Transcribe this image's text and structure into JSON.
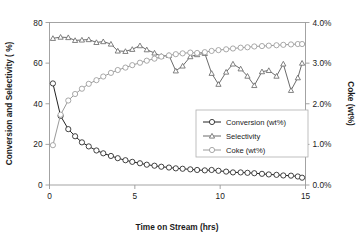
{
  "chart_data": {
    "type": "line",
    "title": "",
    "xlabel": "Time on Stream (hrs)",
    "ylabel": "Conversion and Selectivity ( %)",
    "ylabel_right": "Coke (wt%)",
    "xlim": [
      0,
      15
    ],
    "ylim": [
      0,
      80
    ],
    "ylim_right": [
      0.0,
      4.0
    ],
    "xticks": [
      0,
      5,
      10,
      15
    ],
    "xtick_labels": [
      "0",
      "5",
      "10",
      "15"
    ],
    "yticks": [
      0,
      20,
      40,
      60,
      80
    ],
    "ytick_labels": [
      "0",
      "20",
      "40",
      "60",
      "80"
    ],
    "yticks_right": [
      0.0,
      1.0,
      2.0,
      3.0,
      4.0
    ],
    "ytick_labels_right": [
      "0.0%",
      "1.0%",
      "2.0%",
      "3.0%",
      "4.0%"
    ],
    "grid": false,
    "legend_position": "center-right",
    "series": [
      {
        "name": "Conversion (wt%)",
        "axis": "left",
        "marker": "circle",
        "color": "#222222",
        "x": [
          0.2,
          0.65,
          1.1,
          1.5,
          1.9,
          2.3,
          2.75,
          3.15,
          3.6,
          4.0,
          4.45,
          4.85,
          5.3,
          5.7,
          6.15,
          6.55,
          7.0,
          7.4,
          7.8,
          8.25,
          8.65,
          9.1,
          9.5,
          9.9,
          10.35,
          10.75,
          11.2,
          11.6,
          12.0,
          12.45,
          12.85,
          13.3,
          13.7,
          14.15,
          14.55,
          14.8
        ],
        "values": [
          50.0,
          34.0,
          27.5,
          24.0,
          21.0,
          19.0,
          17.0,
          15.6,
          14.3,
          13.2,
          12.2,
          11.4,
          10.7,
          10.0,
          9.5,
          9.0,
          8.6,
          8.2,
          8.0,
          7.7,
          7.4,
          7.2,
          7.4,
          7.0,
          6.6,
          6.2,
          6.2,
          6.0,
          5.8,
          5.5,
          5.2,
          5.0,
          4.7,
          4.6,
          4.2,
          3.6
        ]
      },
      {
        "name": "Selectivity",
        "axis": "left",
        "marker": "triangle",
        "color": "#6b6b6b",
        "x": [
          0.2,
          0.65,
          1.1,
          1.5,
          1.9,
          2.3,
          2.75,
          3.15,
          3.6,
          4.0,
          4.45,
          4.85,
          5.3,
          5.7,
          6.15,
          6.55,
          7.0,
          7.4,
          7.8,
          8.25,
          8.65,
          9.1,
          9.5,
          9.9,
          10.35,
          10.75,
          11.2,
          11.6,
          12.0,
          12.45,
          12.85,
          13.3,
          13.7,
          14.15,
          14.55,
          14.8
        ],
        "values": [
          72.2,
          72.8,
          72.6,
          71.2,
          71.4,
          71.6,
          70.2,
          70.6,
          69.4,
          66.0,
          65.8,
          66.8,
          68.6,
          66.6,
          65.0,
          63.4,
          63.8,
          56.2,
          58.6,
          63.2,
          64.2,
          64.8,
          55.0,
          49.6,
          55.6,
          59.6,
          57.2,
          53.6,
          49.0,
          55.8,
          56.4,
          53.6,
          59.6,
          46.6,
          52.8,
          60.0
        ]
      },
      {
        "name": "Coke (wt%)",
        "axis": "right",
        "marker": "circle",
        "color": "#9a9a9a",
        "x": [
          0.2,
          0.65,
          1.1,
          1.5,
          1.9,
          2.3,
          2.75,
          3.15,
          3.6,
          4.0,
          4.45,
          4.85,
          5.3,
          5.7,
          6.15,
          6.55,
          7.0,
          7.4,
          7.8,
          8.25,
          8.65,
          9.1,
          9.5,
          9.9,
          10.35,
          10.75,
          11.2,
          11.6,
          12.0,
          12.45,
          12.85,
          13.3,
          13.7,
          14.15,
          14.55,
          14.8
        ],
        "values": [
          0.98,
          1.73,
          2.08,
          2.24,
          2.37,
          2.49,
          2.58,
          2.67,
          2.76,
          2.83,
          2.89,
          2.95,
          3.01,
          3.06,
          3.11,
          3.16,
          3.19,
          3.22,
          3.24,
          3.26,
          3.25,
          3.27,
          3.3,
          3.32,
          3.34,
          3.36,
          3.38,
          3.39,
          3.41,
          3.42,
          3.43,
          3.44,
          3.45,
          3.46,
          3.47,
          3.47
        ]
      }
    ],
    "legend": [
      {
        "label": "Conversion (wt%)",
        "marker": "circle",
        "color": "#222222"
      },
      {
        "label": "Selectivity",
        "marker": "triangle",
        "color": "#6b6b6b"
      },
      {
        "label": "Coke (wt%)",
        "marker": "circle",
        "color": "#9a9a9a"
      }
    ]
  }
}
